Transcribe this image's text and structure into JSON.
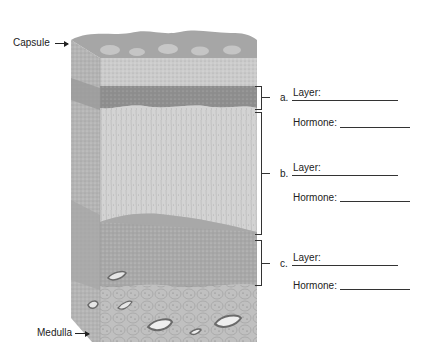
{
  "diagram": {
    "pointer_labels": {
      "top": "Capsule",
      "bottom": "Medulla"
    },
    "layers": [
      {
        "letter": "a.",
        "layer_label": "Layer:",
        "hormone_label": "Hormone:"
      },
      {
        "letter": "b.",
        "layer_label": "Layer:",
        "hormone_label": "Hormone:"
      },
      {
        "letter": "c.",
        "layer_label": "Layer:",
        "hormone_label": "Hormone:"
      }
    ],
    "colors": {
      "capsule": "#a8a8a8",
      "capsule_highlight": "#cfcfcf",
      "layer_a": "#8f8f8f",
      "layer_b": "#d4d4d4",
      "layer_c": "#a9a9a9",
      "medulla": "#bdbdbd",
      "side_face": "#b5b5b5",
      "line": "#333333"
    }
  }
}
